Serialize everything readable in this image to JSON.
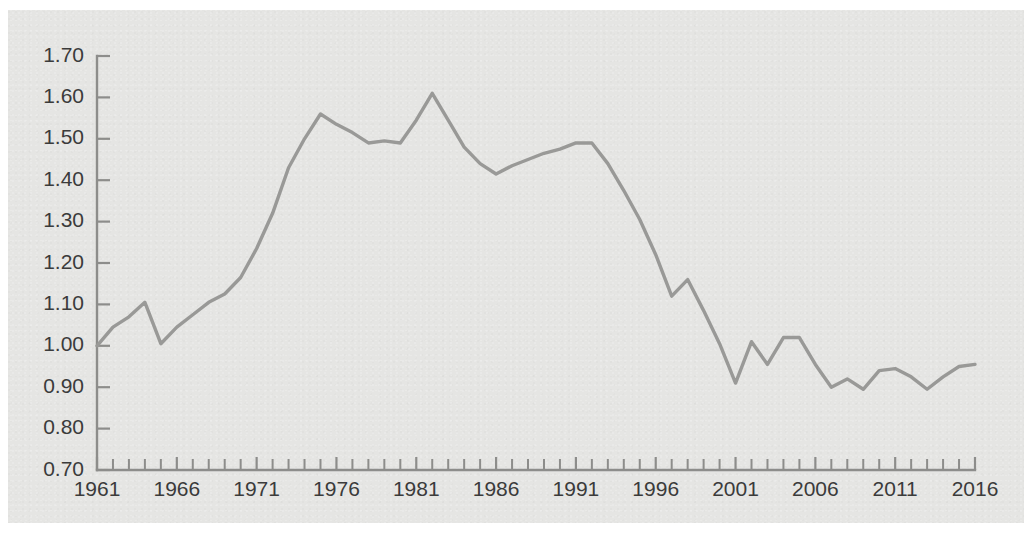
{
  "chart_data": {
    "type": "line",
    "title": "",
    "subtitle": "",
    "xlabel": "",
    "ylabel": "",
    "xlim": [
      1961,
      2016
    ],
    "ylim": [
      0.7,
      1.7
    ],
    "grid": false,
    "legend": false,
    "legend_position": "none",
    "x_tick_labels": [
      "1961",
      "1966",
      "1971",
      "1976",
      "1981",
      "1986",
      "1991",
      "1996",
      "2001",
      "2006",
      "2011",
      "2016"
    ],
    "x_tick_values": [
      1961,
      1966,
      1971,
      1976,
      1981,
      1986,
      1991,
      1996,
      2001,
      2006,
      2011,
      2016
    ],
    "x_minor_tick_step": 1,
    "y_tick_labels": [
      "0.70",
      "0.80",
      "0.90",
      "1.00",
      "1.10",
      "1.20",
      "1.30",
      "1.40",
      "1.50",
      "1.60",
      "1.70"
    ],
    "y_tick_values": [
      0.7,
      0.8,
      0.9,
      1.0,
      1.1,
      1.2,
      1.3,
      1.4,
      1.5,
      1.6,
      1.7
    ],
    "x": [
      1961,
      1962,
      1963,
      1964,
      1965,
      1966,
      1967,
      1968,
      1969,
      1970,
      1971,
      1972,
      1973,
      1974,
      1975,
      1976,
      1977,
      1978,
      1979,
      1980,
      1981,
      1982,
      1983,
      1984,
      1985,
      1986,
      1987,
      1988,
      1989,
      1990,
      1991,
      1992,
      1993,
      1994,
      1995,
      1996,
      1997,
      1998,
      1999,
      2000,
      2001,
      2002,
      2003,
      2004,
      2005,
      2006,
      2007,
      2008,
      2009,
      2010,
      2011,
      2012,
      2013,
      2014,
      2015,
      2016
    ],
    "values": [
      1.0,
      1.045,
      1.07,
      1.105,
      1.005,
      1.045,
      1.075,
      1.105,
      1.125,
      1.165,
      1.235,
      1.32,
      1.43,
      1.5,
      1.56,
      1.535,
      1.515,
      1.49,
      1.495,
      1.49,
      1.545,
      1.61,
      1.545,
      1.48,
      1.44,
      1.415,
      1.435,
      1.45,
      1.465,
      1.475,
      1.49,
      1.49,
      1.44,
      1.375,
      1.305,
      1.22,
      1.12,
      1.16,
      1.085,
      1.005,
      0.91,
      1.01,
      0.955,
      1.02,
      1.02,
      0.955,
      0.9,
      0.92,
      0.895,
      0.94,
      0.945,
      0.925,
      0.895,
      0.925,
      0.95,
      0.955
    ],
    "series": [
      {
        "name": "series-1",
        "color": "#999997",
        "values": [
          1.0,
          1.045,
          1.07,
          1.105,
          1.005,
          1.045,
          1.075,
          1.105,
          1.125,
          1.165,
          1.235,
          1.32,
          1.43,
          1.5,
          1.56,
          1.535,
          1.515,
          1.49,
          1.495,
          1.49,
          1.545,
          1.61,
          1.545,
          1.48,
          1.44,
          1.415,
          1.435,
          1.45,
          1.465,
          1.475,
          1.49,
          1.49,
          1.44,
          1.375,
          1.305,
          1.22,
          1.12,
          1.16,
          1.085,
          1.005,
          0.91,
          1.01,
          0.955,
          1.02,
          1.02,
          0.955,
          0.9,
          0.92,
          0.895,
          0.94,
          0.945,
          0.925,
          0.895,
          0.925,
          0.95,
          0.955
        ]
      }
    ],
    "annotations": []
  },
  "style": {
    "background": "#e5e5e3",
    "page_background": "#ffffff",
    "axis_color": "#8d8d8b",
    "line_color": "#999997",
    "label_color": "#3b3b3b"
  },
  "geometry": {
    "plot_left": 97,
    "plot_right": 975,
    "plot_top": 56,
    "plot_bottom": 470,
    "y_label_x": 84,
    "x_label_y": 481,
    "tick_len_major": 13,
    "tick_len_minor": 11
  }
}
